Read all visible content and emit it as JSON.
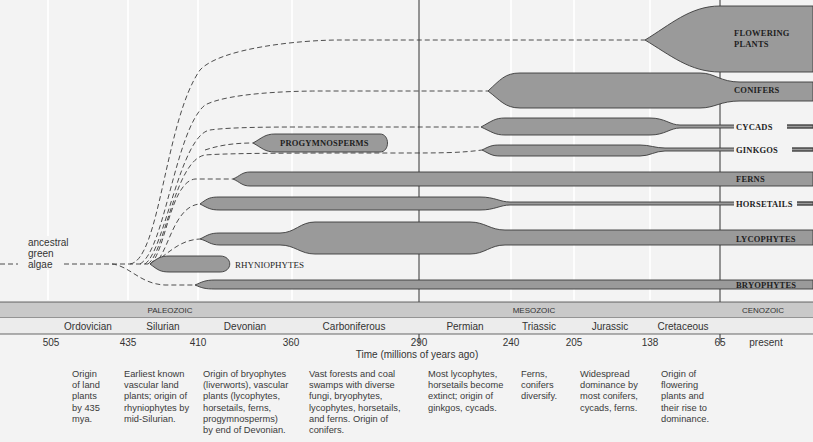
{
  "ancestor_label": [
    "ancestral",
    "green",
    "algae"
  ],
  "lineages": [
    {
      "id": "flowering-plants",
      "label_lines": [
        "FLOWERING",
        "PLANTS"
      ],
      "origin_mya": 138
    },
    {
      "id": "conifers",
      "label": "CONIFERS",
      "origin_mya": 290
    },
    {
      "id": "cycads",
      "label": "CYCADS",
      "origin_mya": 240
    },
    {
      "id": "ginkgos",
      "label": "GINKGOS",
      "origin_mya": 240
    },
    {
      "id": "progymnosperms",
      "label": "PROGYMNOSPERMS",
      "extinct": true
    },
    {
      "id": "ferns",
      "label": "FERNS"
    },
    {
      "id": "horsetails",
      "label": "HORSETAILS"
    },
    {
      "id": "lycophytes",
      "label": "LYCOPHYTES"
    },
    {
      "id": "rhyniophytes",
      "label": "RHYNIOPHYTES",
      "extinct": true
    },
    {
      "id": "bryophytes",
      "label": "BRYOPHYTES"
    }
  ],
  "eras": [
    {
      "label": "PALEOZOIC"
    },
    {
      "label": "MESOZOIC"
    },
    {
      "label": "CENOZOIC"
    }
  ],
  "periods": [
    "Ordovician",
    "Silurian",
    "Devonian",
    "Carboniferous",
    "Permian",
    "Triassic",
    "Jurassic",
    "Cretaceous"
  ],
  "ticks": [
    "505",
    "435",
    "410",
    "360",
    "290",
    "240",
    "205",
    "138",
    "65",
    "present"
  ],
  "axis_label": "Time (millions of years ago)",
  "descriptions": [
    "Origin of land plants by 435 mya.",
    "Earliest known vascular land plants; origin of rhyniophytes by mid-Silurian.",
    "Origin of bryophytes (liverworts), vascular plants (lycophytes, horsetails, ferns, progymnosperms) by end of Devonian.",
    "Vast forests and coal swamps with diverse fungi, bryophytes, lycophytes, horsetails, and ferns. Origin of conifers.",
    "Most lycophytes, horsetails become extinct; origin of ginkgos, cycads.",
    "Ferns, conifers diversify.",
    "Widespread dominance by most conifers, cycads, ferns.",
    "Origin of flowering plants and their rise to dominance."
  ],
  "descriptions_lines": [
    [
      "Origin",
      "of land",
      "plants",
      "by 435",
      "mya."
    ],
    [
      "Earliest known",
      "vascular land",
      "plants; origin of",
      "rhyniophytes by",
      "mid-Silurian."
    ],
    [
      "Origin of bryophytes",
      "(liverworts), vascular",
      "plants (lycophytes,",
      "horsetails, ferns,",
      "progymnosperms)",
      "by end of Devonian."
    ],
    [
      "Vast forests and coal",
      "swamps with diverse",
      "fungi, bryophytes,",
      "lycophytes, horsetails,",
      "and ferns. Origin of",
      "conifers."
    ],
    [
      "Most lycophytes,",
      "horsetails become",
      "extinct; origin of",
      "ginkgos, cycads."
    ],
    [
      "Ferns,",
      "conifers",
      "diversify."
    ],
    [
      "Widespread",
      "dominance by",
      "most conifers,",
      "cycads, ferns."
    ],
    [
      "Origin of",
      "flowering",
      "plants and",
      "their rise to",
      "dominance."
    ]
  ],
  "colors": {
    "background": "#f3f3f3",
    "lineage_fill": "#9a9a9a",
    "lineage_stroke": "#3a3a3a",
    "era_band": "#c9c9c9",
    "period_band": "#ececec",
    "text": "#333333"
  }
}
